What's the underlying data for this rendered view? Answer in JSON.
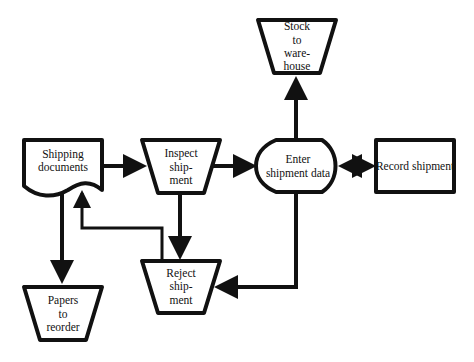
{
  "diagram": {
    "type": "flowchart",
    "nodes": {
      "shipping_documents": {
        "shape": "document",
        "line1": "Shipping",
        "line2": "documents"
      },
      "inspect_shipment": {
        "shape": "manual-operation",
        "line1": "Inspect",
        "line2": "ship-",
        "line3": "ment"
      },
      "enter_shipment_data": {
        "shape": "display",
        "line1": "Enter",
        "line2": "shipment data"
      },
      "record_shipment": {
        "shape": "process",
        "line1": "Record shipment"
      },
      "stock_to_warehouse": {
        "shape": "manual-operation",
        "line1": "Stock",
        "line2": "to",
        "line3": "ware-",
        "line4": "house"
      },
      "reject_shipment": {
        "shape": "manual-operation",
        "line1": "Reject",
        "line2": "ship-",
        "line3": "ment"
      },
      "papers_to_reorder": {
        "shape": "manual-operation",
        "line1": "Papers",
        "line2": "to",
        "line3": "reorder"
      }
    },
    "edges": [
      {
        "from": "Shipping documents",
        "to": "Inspect shipment"
      },
      {
        "from": "Inspect shipment",
        "to": "Enter shipment data"
      },
      {
        "from": "Enter shipment data",
        "to": "Record shipment",
        "bidirectional": true
      },
      {
        "from": "Enter shipment data",
        "to": "Stock to warehouse"
      },
      {
        "from": "Enter shipment data",
        "to": "Reject shipment"
      },
      {
        "from": "Inspect shipment",
        "to": "Reject shipment"
      },
      {
        "from": "Reject shipment",
        "to": "Shipping documents"
      },
      {
        "from": "Shipping documents",
        "to": "Papers to reorder"
      }
    ]
  }
}
